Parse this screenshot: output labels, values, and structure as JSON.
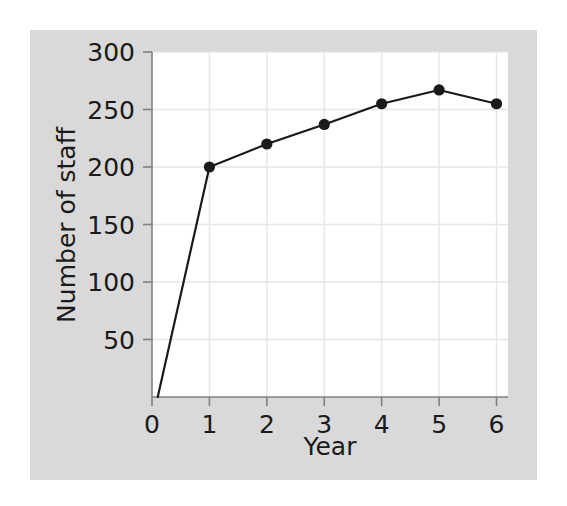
{
  "figure": {
    "background_color": "#d9d9d9",
    "page_color": "#ffffff",
    "plot_background_color": "#ffffff",
    "gridline_color": "#e6e6e6",
    "axis_color": "#808080",
    "line_color": "#1a1a1a",
    "marker_color": "#1a1a1a"
  },
  "chart_data": {
    "type": "line",
    "title": "",
    "xlabel": "Year",
    "ylabel": "Number of staff",
    "x": [
      0.1,
      1,
      2,
      3,
      4,
      5,
      6
    ],
    "values": [
      0,
      200,
      220,
      237,
      255,
      267,
      255
    ],
    "series": [
      {
        "name": "Number of staff",
        "x": [
          0.1,
          1,
          2,
          3,
          4,
          5,
          6
        ],
        "values": [
          0,
          200,
          220,
          237,
          255,
          267,
          255
        ],
        "marker": "circle",
        "color": "#1a1a1a"
      }
    ],
    "markers_shown_at_x": [
      1,
      2,
      3,
      4,
      5,
      6
    ],
    "xlim": [
      0,
      6.2
    ],
    "ylim": [
      0,
      300
    ],
    "xticks": [
      0,
      1,
      2,
      3,
      4,
      5,
      6
    ],
    "xtick_labels": [
      "0",
      "1",
      "2",
      "3",
      "4",
      "5",
      "6"
    ],
    "yticks": [
      50,
      100,
      150,
      200,
      250,
      300
    ],
    "ytick_labels": [
      "50",
      "100",
      "150",
      "200",
      "250",
      "300"
    ],
    "grid": true,
    "legend": "none"
  },
  "axes": {
    "y_title": "Number of staff",
    "x_title": "Year",
    "y_tick_labels": [
      "300",
      "250",
      "200",
      "150",
      "100",
      "50"
    ],
    "x_tick_labels": [
      "0",
      "1",
      "2",
      "3",
      "4",
      "5",
      "6"
    ]
  }
}
